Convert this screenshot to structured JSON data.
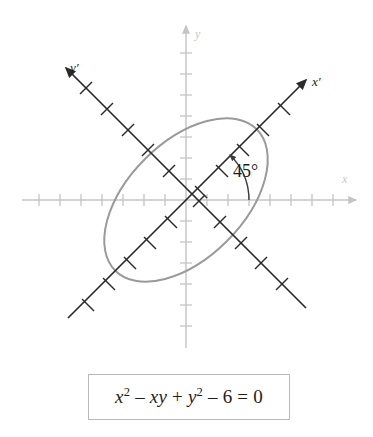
{
  "figure": {
    "background_color": "#ffffff",
    "origin": {
      "x": 186,
      "y": 200
    },
    "axes": {
      "x_axis": {
        "label": "x",
        "label_color": "#c8c8c8",
        "color": "#c4c4c4",
        "tick_count": 15,
        "tick_spacing": 21
      },
      "y_axis": {
        "label": "y",
        "label_color": "#c8c8c8",
        "color": "#c4c4c4",
        "tick_count": 16,
        "tick_spacing": 21
      },
      "x_prime_axis": {
        "label": "x′",
        "label_color": "#1a1a1a",
        "color": "#2b2b2b",
        "rotation_degrees": 45,
        "tick_spacing": 29
      },
      "y_prime_axis": {
        "label": "y′",
        "label_color": "#1a1a1a",
        "color": "#2b2b2b",
        "rotation_degrees": 135,
        "tick_spacing": 29
      }
    },
    "angle_annotation": {
      "label": "45°",
      "value_degrees": 45,
      "color": "#1d1d1d",
      "arc_color": "#3a3a3a",
      "from_axis": "x",
      "to_axis": "x′"
    },
    "curve": {
      "type": "ellipse",
      "color": "#9a9a9a",
      "stroke_width": 2,
      "semi_major_axis": 100,
      "semi_minor_axis": 58,
      "rotation_degrees": 45
    }
  },
  "equation_box": {
    "border_color": "#b9b9b9",
    "background_color": "#ffffff",
    "equation_plain": "x^2 - xy + y^2 - 6 = 0",
    "terms": {
      "x_var": "x",
      "exp_two_a": "2",
      "minus_one": "–",
      "xy_term": "xy",
      "plus": "+",
      "y_var": "y",
      "exp_two_b": "2",
      "minus_two": "–",
      "six": "6",
      "equals": "=",
      "zero": "0"
    }
  }
}
